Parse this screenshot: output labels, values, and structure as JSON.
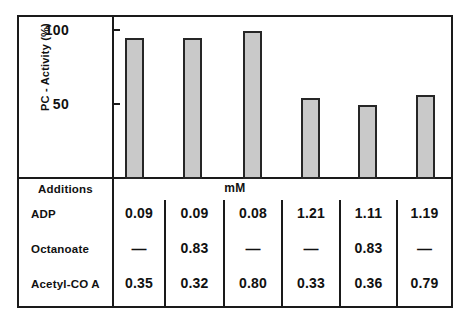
{
  "chart_data": {
    "type": "bar",
    "title": "",
    "subtitle": "",
    "xlabel": "mM",
    "ylabel": "PC - Activity (%)",
    "ylim": [
      0,
      108
    ],
    "yticks": [
      50,
      100
    ],
    "ytick_labels": [
      "50",
      "100"
    ],
    "grid": false,
    "legend": null,
    "categories": [
      "1",
      "2",
      "3",
      "4",
      "5",
      "6"
    ],
    "values": [
      95,
      95,
      100,
      55,
      50,
      57
    ],
    "bar_color": "#c9c9c9",
    "bar_edge_color": "#262626",
    "axis_color": "#1a1a1a",
    "table": {
      "header_label": "Additions",
      "units_label": "mM",
      "row_labels": [
        "ADP",
        "Octanoate",
        "Acetyl-CO A"
      ],
      "rows": [
        {
          "label": "ADP",
          "values": [
            "0.09",
            "0.09",
            "0.08",
            "1.21",
            "1.11",
            "1.19"
          ]
        },
        {
          "label": "Octanoate",
          "values": [
            "—",
            "0.83",
            "—",
            "—",
            "0.83",
            "—"
          ]
        },
        {
          "label": "Acetyl-CO A",
          "values": [
            "0.35",
            "0.32",
            "0.80",
            "0.33",
            "0.36",
            "0.79"
          ]
        }
      ]
    }
  },
  "axis": {
    "tick_100": "100",
    "tick_50": "50",
    "y_title": "PC - Activity (%)"
  },
  "table": {
    "additions": "Additions",
    "units": "mM",
    "r0_label": "ADP",
    "r0_c0": "0.09",
    "r0_c1": "0.09",
    "r0_c2": "0.08",
    "r0_c3": "1.21",
    "r0_c4": "1.11",
    "r0_c5": "1.19",
    "r1_label": "Octanoate",
    "r1_c0": "—",
    "r1_c1": "0.83",
    "r1_c2": "—",
    "r1_c3": "—",
    "r1_c4": "0.83",
    "r1_c5": "—",
    "r2_label": "Acetyl-CO A",
    "r2_c0": "0.35",
    "r2_c1": "0.32",
    "r2_c2": "0.80",
    "r2_c3": "0.33",
    "r2_c4": "0.36",
    "r2_c5": "0.79"
  }
}
